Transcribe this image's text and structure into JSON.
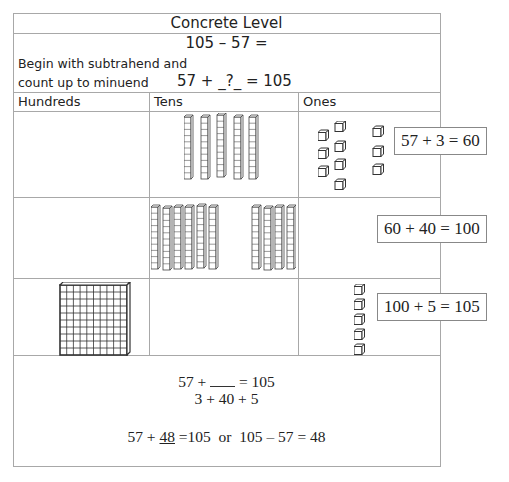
{
  "document": {
    "title": "Concrete Level",
    "problem": "105 – 57 =",
    "instruction_line1": "Begin with subtrahend and",
    "instruction_line2": "count up to minuend",
    "count_up_equation": "57 + _?_  = 105",
    "columns": [
      "Hundreds",
      "Tens",
      "Ones"
    ],
    "rows": [
      {
        "hundreds_flats": 0,
        "tens_rods": 5,
        "ones_cubes": 10,
        "ones_groups": "7 cubes (original ones) + 3 cubes (added)",
        "step_equation": "57 + 3 = 60"
      },
      {
        "hundreds_flats": 0,
        "tens_rods": 10,
        "tens_groups": "6 rods (existing) + 4 rods (added)",
        "ones_cubes": 0,
        "step_equation": "60 + 40 = 100"
      },
      {
        "hundreds_flats": 1,
        "tens_rods": 0,
        "ones_cubes": 5,
        "step_equation": "100 + 5 = 105"
      }
    ],
    "summary": {
      "line1_left": "57 +",
      "line1_right": "= 105",
      "line2": "3 + 40 + 5",
      "line3_a": "57 +",
      "line3_answer": "48",
      "line3_b": "=105  or  105 – 57 = 48"
    }
  },
  "colors": {
    "border": "#a8a8a8",
    "block_stroke": "#444444",
    "text": "#222222"
  }
}
